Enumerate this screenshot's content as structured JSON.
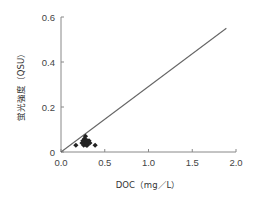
{
  "chart_data": {
    "type": "scatter",
    "title": "",
    "xlabel": "DOC（mg／L）",
    "ylabel": "蛍光強度（QSU）",
    "xlim": [
      0,
      2.0
    ],
    "ylim": [
      0,
      0.6
    ],
    "x_ticks": [
      "0.0",
      "0.5",
      "1.0",
      "1.5",
      "2.0"
    ],
    "y_ticks": [
      "0",
      "0.2",
      "0.4",
      "0.6"
    ],
    "grid": false,
    "legend": null,
    "series": [
      {
        "name": "samples",
        "marker": "diamond",
        "color": "#222222",
        "points": [
          {
            "x": 0.17,
            "y": 0.03
          },
          {
            "x": 0.24,
            "y": 0.04
          },
          {
            "x": 0.25,
            "y": 0.05
          },
          {
            "x": 0.26,
            "y": 0.03
          },
          {
            "x": 0.27,
            "y": 0.04
          },
          {
            "x": 0.27,
            "y": 0.06
          },
          {
            "x": 0.28,
            "y": 0.05
          },
          {
            "x": 0.28,
            "y": 0.07
          },
          {
            "x": 0.29,
            "y": 0.03
          },
          {
            "x": 0.29,
            "y": 0.04
          },
          {
            "x": 0.3,
            "y": 0.05
          },
          {
            "x": 0.3,
            "y": 0.03
          },
          {
            "x": 0.31,
            "y": 0.04
          },
          {
            "x": 0.32,
            "y": 0.05
          },
          {
            "x": 0.33,
            "y": 0.04
          },
          {
            "x": 0.39,
            "y": 0.03
          }
        ]
      }
    ],
    "reference_line": {
      "type": "line",
      "from": {
        "x": 0.0,
        "y": 0.0
      },
      "to": {
        "x": 1.89,
        "y": 0.55
      },
      "color": "#666666"
    }
  },
  "labels": {
    "xlabel": "DOC（mg／L）",
    "ylabel": "蛍光強度（QSU）"
  }
}
